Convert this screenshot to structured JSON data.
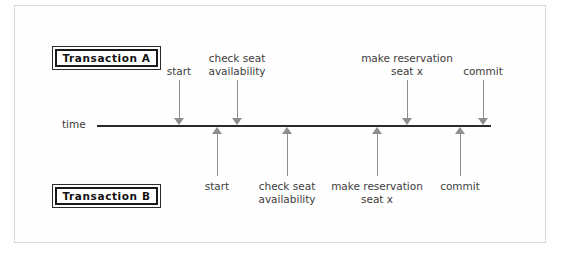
{
  "figure": {
    "axis": {
      "label": "time",
      "name": "time-axis"
    },
    "transaction_a": {
      "box_label": "Transaction A",
      "side": "top",
      "events": [
        {
          "label_lines": [
            "start"
          ],
          "x": 179,
          "label_x": 179
        },
        {
          "label_lines": [
            "check seat",
            "availability"
          ],
          "x": 237,
          "label_x": 237
        },
        {
          "label_lines": [
            "make reservation",
            "seat x"
          ],
          "x": 407,
          "label_x": 407
        },
        {
          "label_lines": [
            "commit"
          ],
          "x": 483,
          "label_x": 483
        }
      ]
    },
    "transaction_b": {
      "box_label": "Transaction B",
      "side": "bottom",
      "events": [
        {
          "label_lines": [
            "start"
          ],
          "x": 217,
          "label_x": 217
        },
        {
          "label_lines": [
            "check seat",
            "availability"
          ],
          "x": 287,
          "label_x": 287
        },
        {
          "label_lines": [
            "make reservation",
            "seat x"
          ],
          "x": 377,
          "label_x": 377
        },
        {
          "label_lines": [
            "commit"
          ],
          "x": 460,
          "label_x": 460
        }
      ]
    },
    "colors": {
      "axis": "#2a2a2a",
      "arrow": "#8e8e8e",
      "text": "#3d3d3d",
      "box_border": "#1a1a1a",
      "frame": "#d8d8d8"
    }
  },
  "chart_data": {
    "type": "timeline",
    "title": "",
    "xlabel": "time",
    "ylabel": "",
    "grid": false,
    "legend": "none",
    "series": [
      {
        "name": "Transaction A",
        "position": "above-axis",
        "events": [
          "start",
          "check seat availability",
          "make reservation seat x",
          "commit"
        ],
        "x": [
          179,
          237,
          407,
          483
        ]
      },
      {
        "name": "Transaction B",
        "position": "below-axis",
        "events": [
          "start",
          "check seat availability",
          "make reservation seat x",
          "commit"
        ],
        "x": [
          217,
          287,
          377,
          460
        ]
      }
    ],
    "axis_range_px": [
      97,
      491
    ],
    "annotations": [
      "time"
    ]
  }
}
